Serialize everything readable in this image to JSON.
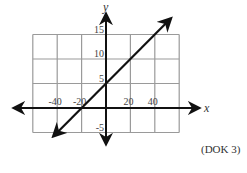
{
  "chart_data": {
    "type": "line",
    "title": "",
    "xlabel": "x",
    "ylabel": "y",
    "x_ticks": [
      {
        "value": -40,
        "label": "-40"
      },
      {
        "value": -20,
        "label": "-20"
      },
      {
        "value": 20,
        "label": "20"
      },
      {
        "value": 40,
        "label": "40"
      }
    ],
    "y_ticks": [
      {
        "value": 15,
        "label": "15"
      },
      {
        "value": 10,
        "label": "10"
      },
      {
        "value": 5,
        "label": "5"
      },
      {
        "value": -5,
        "label": "-5"
      }
    ],
    "xlim": [
      -60,
      60
    ],
    "ylim": [
      -5,
      15
    ],
    "grid": true,
    "series": [
      {
        "name": "line",
        "equation": "y = x/4 + 5",
        "slope": 0.25,
        "intercept": 5,
        "x": [
          -20,
          0,
          20
        ],
        "y": [
          0,
          5,
          10
        ]
      }
    ]
  },
  "annotation": "(DOK 3)",
  "colors": {
    "grid": "#9a9a9a",
    "axis": "#111111",
    "line": "#111111"
  }
}
